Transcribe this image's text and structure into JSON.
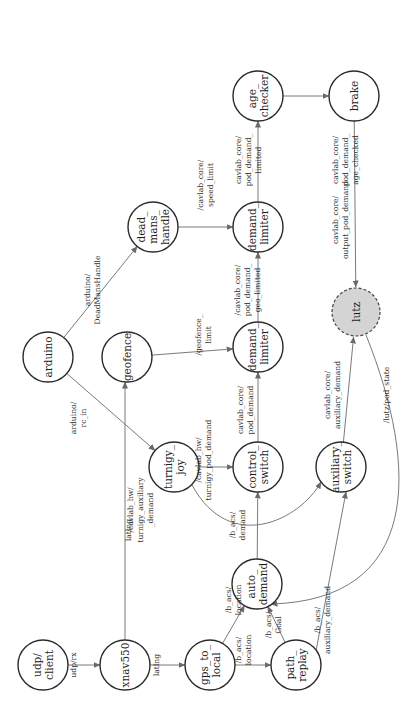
{
  "diagram": {
    "orientation": "rotated-90-ccw",
    "nodes": [
      {
        "id": "udp_client",
        "lines": [
          "udp/",
          "client"
        ]
      },
      {
        "id": "xnav550",
        "lines": [
          "xnav550"
        ]
      },
      {
        "id": "gps_to_local",
        "lines": [
          "gps_to_",
          "local"
        ]
      },
      {
        "id": "path_replay",
        "lines": [
          "path_",
          "replay"
        ]
      },
      {
        "id": "auto_demand",
        "lines": [
          "auto_",
          "demand"
        ]
      },
      {
        "id": "turnigy_joy",
        "lines": [
          "turnigy_",
          "joy"
        ]
      },
      {
        "id": "control_switch",
        "lines": [
          "control_",
          "switch"
        ]
      },
      {
        "id": "auxiliary_switch",
        "lines": [
          "auxiliary_",
          "switch"
        ]
      },
      {
        "id": "arduino",
        "lines": [
          "arduino"
        ]
      },
      {
        "id": "geofence",
        "lines": [
          "geofence"
        ]
      },
      {
        "id": "demand_limiter_geo",
        "lines": [
          "demand_",
          "limiter"
        ]
      },
      {
        "id": "lutz",
        "lines": [
          "lutz"
        ],
        "style": "dashed-filled"
      },
      {
        "id": "dead_mans_handle",
        "lines": [
          "dead_",
          "mans_",
          "handle"
        ]
      },
      {
        "id": "demand_limiter_speed",
        "lines": [
          "demand_",
          "limiter"
        ]
      },
      {
        "id": "age_checker",
        "lines": [
          "age_",
          "checker"
        ]
      },
      {
        "id": "brake",
        "lines": [
          "brake"
        ]
      }
    ],
    "edges": [
      {
        "from": "udp_client",
        "to": "xnav550",
        "label": [
          "udp/rx"
        ]
      },
      {
        "from": "xnav550",
        "to": "gps_to_local",
        "label": [
          "latlng"
        ]
      },
      {
        "from": "xnav550",
        "to": "geofence",
        "label": [
          "latlng"
        ]
      },
      {
        "from": "gps_to_local",
        "to": "auto_demand",
        "label": [
          "/b_acs/",
          "location"
        ]
      },
      {
        "from": "gps_to_local",
        "to": "path_replay",
        "label": [
          "/b_acs/",
          "location"
        ]
      },
      {
        "from": "path_replay",
        "to": "auto_demand",
        "label": [
          "/b_acs/",
          "Goal"
        ]
      },
      {
        "from": "path_replay",
        "to": "auxiliary_switch",
        "label": [
          "/b_acs/",
          "auxiliary_demand"
        ]
      },
      {
        "from": "auto_demand",
        "to": "control_switch",
        "label": [
          "/b_acs/",
          "demand"
        ]
      },
      {
        "from": "turnigy_joy",
        "to": "control_switch",
        "label": [
          "/cavlab_hw/",
          "turnigy_pod_demand"
        ]
      },
      {
        "from": "turnigy_joy",
        "to": "auxiliary_switch",
        "label": [
          "/cavlab_hw/",
          "turnigy_auxiliary",
          "_demand"
        ]
      },
      {
        "from": "arduino",
        "to": "turnigy_joy",
        "label": [
          "arduino/",
          "rc_in"
        ]
      },
      {
        "from": "arduino",
        "to": "dead_mans_handle",
        "label": [
          "arduino/",
          "DeadMansHandle"
        ]
      },
      {
        "from": "geofence",
        "to": "demand_limiter_geo",
        "label": [
          "/geofence_",
          "limit"
        ]
      },
      {
        "from": "control_switch",
        "to": "demand_limiter_geo",
        "label": [
          "cavlab_core/",
          "pod_demand"
        ]
      },
      {
        "from": "demand_limiter_geo",
        "to": "demand_limiter_speed",
        "label": [
          "/cavlab_core/",
          "pod_demand_",
          "geo_limited"
        ]
      },
      {
        "from": "dead_mans_handle",
        "to": "demand_limiter_speed",
        "label": [
          "/cavlab_core/",
          "speed_limit"
        ]
      },
      {
        "from": "demand_limiter_speed",
        "to": "age_checker",
        "label": [
          "cavlab_core/",
          "pod_demand_",
          "limited"
        ]
      },
      {
        "from": "age_checker",
        "to": "brake",
        "label": [
          "cavlab_core/",
          "pod_demand_",
          "age_checked"
        ]
      },
      {
        "from": "brake",
        "to": "lutz",
        "label": [
          "cavlab_core/",
          "output_pod_demand"
        ]
      },
      {
        "from": "auxiliary_switch",
        "to": "lutz",
        "label": [
          "cavlab_core/",
          "auxiliary_demand"
        ]
      },
      {
        "from": "lutz",
        "to": "auto_demand",
        "label": [
          "/lutz/pod_state"
        ]
      }
    ]
  }
}
